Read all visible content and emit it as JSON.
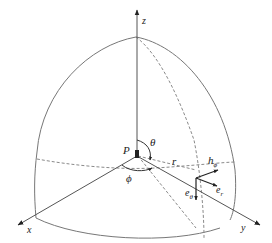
{
  "diagram": {
    "colors": {
      "line": "#777777",
      "dashed": "#8a8a8a",
      "arrow": "#222222",
      "text": "#222222",
      "background": "#ffffff"
    },
    "labels": {
      "z_axis": "z",
      "x_axis": "x",
      "y_axis": "y",
      "origin": "P",
      "theta": "θ",
      "phi": "ϕ",
      "radius": "r",
      "h_phi": "h",
      "h_phi_sub": "ϕ",
      "e_r": "e",
      "e_r_sub": "r",
      "e_theta": "e",
      "e_theta_sub": "θ"
    }
  }
}
